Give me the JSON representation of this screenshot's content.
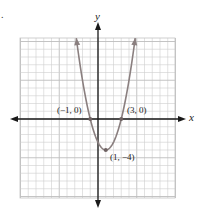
{
  "marker": ".",
  "chart_data": {
    "type": "line",
    "title": "",
    "function": "y = (x - 1)^2 - 4",
    "xlabel": "x",
    "ylabel": "y",
    "xlim": [
      -10,
      10
    ],
    "ylim": [
      -10.5,
      10.5
    ],
    "grid": true,
    "grid_step": 1,
    "series": [
      {
        "name": "parabola",
        "x": [
          -2.8,
          -2,
          -1,
          0,
          1,
          2,
          3,
          4,
          4.8
        ],
        "y": [
          10.44,
          5,
          0,
          -3,
          -4,
          -3,
          0,
          5,
          10.44
        ]
      }
    ],
    "annotations": [
      {
        "label": "(−1, 0)",
        "x": -1,
        "y": 0
      },
      {
        "label": "(3, 0)",
        "x": 3,
        "y": 0
      },
      {
        "label": "(1, −4)",
        "x": 1,
        "y": -4
      }
    ],
    "colors": {
      "curve": "#8a7f7f",
      "axes": "#1a1a1a",
      "grid": "#cfcfcf",
      "point": "#6e6262"
    }
  }
}
